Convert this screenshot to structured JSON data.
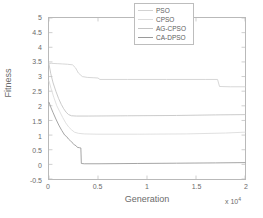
{
  "chart_data": {
    "type": "line",
    "title": "",
    "xlabel": "Generation",
    "ylabel": "Fitness",
    "x_multiplier": "x 10",
    "x_exponent": "4",
    "xlim": [
      0,
      20000
    ],
    "ylim": [
      -0.5,
      5
    ],
    "grid": false,
    "legend_position": "top-right",
    "xticks": [
      0,
      5000,
      10000,
      15000,
      20000
    ],
    "xticklabels": [
      "0",
      "0.5",
      "1",
      "1.5",
      "2"
    ],
    "yticks": [
      -0.5,
      0,
      0.5,
      1,
      1.5,
      2,
      2.5,
      3,
      3.5,
      4,
      4.5,
      5
    ],
    "yticklabels": [
      "-0.5",
      "0",
      "0.5",
      "1",
      "1.5",
      "2",
      "2.5",
      "3",
      "3.5",
      "4",
      "4.5",
      "5"
    ],
    "series": [
      {
        "name": "PSO",
        "color": "#d2d2d2",
        "points": [
          [
            0,
            3.45
          ],
          [
            250,
            3.45
          ],
          [
            900,
            3.44
          ],
          [
            1400,
            3.43
          ],
          [
            1900,
            3.42
          ],
          [
            2400,
            3.4
          ],
          [
            2700,
            3.3
          ],
          [
            3000,
            3.12
          ],
          [
            3400,
            3.0
          ],
          [
            3900,
            2.97
          ],
          [
            4500,
            2.96
          ],
          [
            5000,
            2.95
          ],
          [
            5200,
            2.9
          ],
          [
            8000,
            2.9
          ],
          [
            12000,
            2.9
          ],
          [
            16000,
            2.9
          ],
          [
            17200,
            2.9
          ],
          [
            17400,
            2.66
          ],
          [
            18500,
            2.65
          ],
          [
            20000,
            2.65
          ]
        ]
      },
      {
        "name": "CPSO",
        "color": "#dcdcdc",
        "points": [
          [
            0,
            2.85
          ],
          [
            200,
            2.6
          ],
          [
            500,
            2.28
          ],
          [
            800,
            2.0
          ],
          [
            1100,
            1.8
          ],
          [
            1400,
            1.6
          ],
          [
            1700,
            1.42
          ],
          [
            2000,
            1.28
          ],
          [
            2300,
            1.18
          ],
          [
            2600,
            1.1
          ],
          [
            3000,
            1.06
          ],
          [
            3600,
            1.04
          ],
          [
            5000,
            1.03
          ],
          [
            9000,
            1.03
          ],
          [
            14000,
            1.04
          ],
          [
            18000,
            1.07
          ],
          [
            20000,
            1.1
          ]
        ]
      },
      {
        "name": "AG-CPSO",
        "color": "#c4c4c4",
        "points": [
          [
            0,
            3.42
          ],
          [
            180,
            3.1
          ],
          [
            420,
            2.78
          ],
          [
            700,
            2.5
          ],
          [
            980,
            2.25
          ],
          [
            1250,
            2.05
          ],
          [
            1500,
            1.9
          ],
          [
            1750,
            1.78
          ],
          [
            2000,
            1.7
          ],
          [
            2300,
            1.66
          ],
          [
            2800,
            1.65
          ],
          [
            4000,
            1.65
          ],
          [
            8000,
            1.66
          ],
          [
            13000,
            1.67
          ],
          [
            17000,
            1.69
          ],
          [
            20000,
            1.7
          ]
        ]
      },
      {
        "name": "CA-DPSO",
        "color": "#9a9a9a",
        "points": [
          [
            0,
            2.12
          ],
          [
            150,
            1.98
          ],
          [
            400,
            1.78
          ],
          [
            700,
            1.55
          ],
          [
            1000,
            1.34
          ],
          [
            1300,
            1.16
          ],
          [
            1600,
            1.0
          ],
          [
            1800,
            0.95
          ],
          [
            2000,
            0.86
          ],
          [
            2200,
            0.8
          ],
          [
            2450,
            0.72
          ],
          [
            2600,
            0.66
          ],
          [
            2750,
            0.64
          ],
          [
            2900,
            0.58
          ],
          [
            3100,
            0.57
          ],
          [
            3250,
            0.56
          ],
          [
            3300,
            0.03
          ],
          [
            3600,
            0.02
          ],
          [
            5000,
            0.02
          ],
          [
            9000,
            0.03
          ],
          [
            13000,
            0.04
          ],
          [
            17000,
            0.05
          ],
          [
            20000,
            0.06
          ]
        ]
      }
    ]
  },
  "legend": {
    "items": [
      {
        "label": "PSO"
      },
      {
        "label": "CPSO"
      },
      {
        "label": "AG-CPSO"
      },
      {
        "label": "CA-DPSO"
      }
    ]
  }
}
